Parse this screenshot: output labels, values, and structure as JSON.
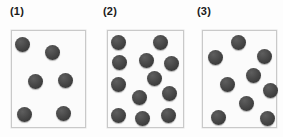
{
  "figure": {
    "type": "diagram",
    "background_color": "#fdfdfd",
    "box_border_color": "#c9c9c9",
    "sphere_color": "#4a4a4a",
    "sphere_diameter_px": 15
  },
  "panels": [
    {
      "label": "(1)",
      "label_x": 10,
      "label_y": 6,
      "box": {
        "x": 11,
        "y": 30,
        "w": 75,
        "h": 98
      },
      "sphere_count": 6,
      "spheres": [
        {
          "x": 14,
          "y": 36
        },
        {
          "x": 44,
          "y": 44
        },
        {
          "x": 27,
          "y": 73
        },
        {
          "x": 57,
          "y": 72
        },
        {
          "x": 16,
          "y": 106
        },
        {
          "x": 55,
          "y": 105
        }
      ]
    },
    {
      "label": "(2)",
      "label_x": 103,
      "label_y": 6,
      "box": {
        "x": 107,
        "y": 30,
        "w": 77,
        "h": 98
      },
      "sphere_count": 12,
      "spheres": [
        {
          "x": 110,
          "y": 34
        },
        {
          "x": 152,
          "y": 34
        },
        {
          "x": 111,
          "y": 54
        },
        {
          "x": 138,
          "y": 52
        },
        {
          "x": 163,
          "y": 55
        },
        {
          "x": 146,
          "y": 70
        },
        {
          "x": 110,
          "y": 76
        },
        {
          "x": 131,
          "y": 89
        },
        {
          "x": 161,
          "y": 85
        },
        {
          "x": 110,
          "y": 107
        },
        {
          "x": 134,
          "y": 110
        },
        {
          "x": 160,
          "y": 107
        }
      ]
    },
    {
      "label": "(3)",
      "label_x": 197,
      "label_y": 6,
      "box": {
        "x": 202,
        "y": 30,
        "w": 75,
        "h": 98
      },
      "sphere_count": 9,
      "spheres": [
        {
          "x": 230,
          "y": 34
        },
        {
          "x": 207,
          "y": 49
        },
        {
          "x": 256,
          "y": 48
        },
        {
          "x": 245,
          "y": 67
        },
        {
          "x": 219,
          "y": 76
        },
        {
          "x": 262,
          "y": 82
        },
        {
          "x": 238,
          "y": 95
        },
        {
          "x": 210,
          "y": 109
        },
        {
          "x": 259,
          "y": 110
        }
      ]
    }
  ]
}
